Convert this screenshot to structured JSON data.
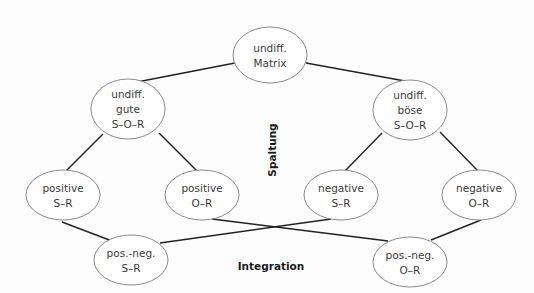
{
  "diagram": {
    "nodes": [
      {
        "id": "matrix",
        "lines": [
          "undiff.",
          "Matrix"
        ],
        "cx": 270,
        "cy": 55,
        "rx": 37,
        "ry": 28
      },
      {
        "id": "gute",
        "lines": [
          "undiff.",
          "gute",
          "S–O–R"
        ],
        "cx": 128,
        "cy": 109,
        "rx": 37,
        "ry": 30
      },
      {
        "id": "boese",
        "lines": [
          "undiff.",
          "böse",
          "S–O–R"
        ],
        "cx": 410,
        "cy": 110,
        "rx": 37,
        "ry": 30
      },
      {
        "id": "pos_sr",
        "lines": [
          "positive",
          "S–R"
        ],
        "cx": 63,
        "cy": 195,
        "rx": 37,
        "ry": 25
      },
      {
        "id": "pos_or",
        "lines": [
          "positive",
          "O–R"
        ],
        "cx": 202,
        "cy": 195,
        "rx": 37,
        "ry": 25
      },
      {
        "id": "neg_sr",
        "lines": [
          "negative",
          "S–R"
        ],
        "cx": 341,
        "cy": 195,
        "rx": 37,
        "ry": 25
      },
      {
        "id": "neg_or",
        "lines": [
          "negative",
          "O–R"
        ],
        "cx": 479,
        "cy": 195,
        "rx": 37,
        "ry": 25
      },
      {
        "id": "posneg_sr",
        "lines": [
          "pos.-neg.",
          "S–R"
        ],
        "cx": 131,
        "cy": 260,
        "rx": 37,
        "ry": 25
      },
      {
        "id": "posneg_or",
        "lines": [
          "pos.-neg.",
          "O–R"
        ],
        "cx": 410,
        "cy": 262,
        "rx": 37,
        "ry": 25
      }
    ],
    "edges": [
      {
        "from": "matrix",
        "to": "gute",
        "x1": 235,
        "y1": 63,
        "x2": 137,
        "y2": 82
      },
      {
        "from": "matrix",
        "to": "boese",
        "x1": 306,
        "y1": 63,
        "x2": 405,
        "y2": 81
      },
      {
        "from": "gute",
        "to": "pos_sr",
        "x1": 103,
        "y1": 134,
        "x2": 66,
        "y2": 171
      },
      {
        "from": "gute",
        "to": "pos_or",
        "x1": 159,
        "y1": 133,
        "x2": 197,
        "y2": 171
      },
      {
        "from": "boese",
        "to": "neg_sr",
        "x1": 382,
        "y1": 133,
        "x2": 345,
        "y2": 171
      },
      {
        "from": "boese",
        "to": "neg_or",
        "x1": 440,
        "y1": 132,
        "x2": 478,
        "y2": 171
      },
      {
        "from": "pos_sr",
        "to": "posneg_sr",
        "x1": 62,
        "y1": 222,
        "x2": 112,
        "y2": 241
      },
      {
        "from": "pos_or",
        "to": "posneg_or",
        "x1": 212,
        "y1": 219,
        "x2": 388,
        "y2": 241
      },
      {
        "from": "neg_sr",
        "to": "posneg_sr",
        "x1": 331,
        "y1": 219,
        "x2": 160,
        "y2": 243
      },
      {
        "from": "neg_or",
        "to": "posneg_or",
        "x1": 481,
        "y1": 220,
        "x2": 431,
        "y2": 240
      }
    ],
    "labels": {
      "spaltung": "Spaltung",
      "integration": "Integration"
    },
    "colors": {
      "edge": "#222222",
      "ellipse_stroke": "#8a8a8a",
      "text": "#3a3a3a",
      "background": "#fdfdfd"
    }
  }
}
